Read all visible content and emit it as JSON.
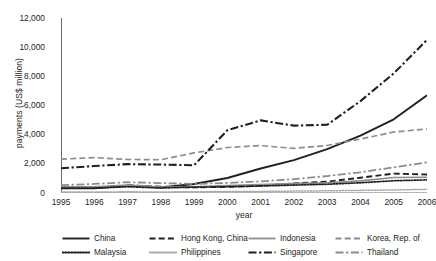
{
  "chart_data": {
    "type": "line",
    "title": "",
    "xlabel": "year",
    "ylabel": "payments (US$ million)",
    "x": [
      1995,
      1996,
      1997,
      1998,
      1999,
      2000,
      2001,
      2002,
      2003,
      2004,
      2005,
      2006
    ],
    "xtick_labels": [
      "1995",
      "1996",
      "1997",
      "1998",
      "1999",
      "2000",
      "2001",
      "2002",
      "2003",
      "2004",
      "2005",
      "2006"
    ],
    "ytick_labels": [
      "0",
      "2,000",
      "4,000",
      "6,000",
      "8,000",
      "10,000",
      "12,000"
    ],
    "yticks": [
      0,
      2000,
      4000,
      6000,
      8000,
      10000,
      12000
    ],
    "ylim": [
      0,
      12000
    ],
    "xlim": [
      1995,
      2006
    ],
    "grid": false,
    "legend_position": "bottom",
    "series": [
      {
        "name": "China",
        "style": "solid",
        "color": "#231f20",
        "width": 1.9,
        "values": [
          320,
          330,
          500,
          380,
          620,
          1030,
          1680,
          2250,
          3010,
          3940,
          5050,
          6700
        ]
      },
      {
        "name": "Hong Kong, China",
        "style": "dashed",
        "color": "#231f20",
        "width": 1.9,
        "values": [
          null,
          null,
          530,
          430,
          390,
          420,
          500,
          650,
          780,
          1050,
          1330,
          1270
        ]
      },
      {
        "name": "Indonesia",
        "style": "solid",
        "color": "#8c8c8c",
        "width": 1.6,
        "values": [
          430,
          430,
          540,
          400,
          430,
          510,
          580,
          640,
          700,
          830,
          1060,
          1080
        ]
      },
      {
        "name": "Korea, Rep. of",
        "style": "dashed",
        "color": "#8c8c8c",
        "width": 1.7,
        "values": [
          2320,
          2430,
          2300,
          2280,
          2750,
          3120,
          3250,
          3060,
          3260,
          3700,
          4180,
          4390
        ]
      },
      {
        "name": "Malaysia",
        "style": "dotted",
        "color": "#231f20",
        "width": 1.7,
        "values": [
          330,
          330,
          430,
          340,
          400,
          430,
          480,
          540,
          600,
          700,
          840,
          900
        ]
      },
      {
        "name": "Philippines",
        "style": "dotted",
        "color": "#a6a6a6",
        "width": 1.5,
        "values": [
          60,
          70,
          80,
          70,
          90,
          100,
          110,
          130,
          150,
          180,
          210,
          250
        ]
      },
      {
        "name": "Singapore",
        "style": "dashdot",
        "color": "#231f20",
        "width": 2.1,
        "values": [
          1700,
          1850,
          1980,
          1950,
          1900,
          4300,
          4980,
          4620,
          4680,
          6300,
          8200,
          10500
        ]
      },
      {
        "name": "Thailand",
        "style": "dashdot",
        "color": "#8c8c8c",
        "width": 1.8,
        "values": [
          540,
          620,
          740,
          680,
          620,
          690,
          800,
          950,
          1160,
          1420,
          1760,
          2100
        ]
      }
    ]
  },
  "legend": {
    "items": [
      {
        "label": "China"
      },
      {
        "label": "Hong Kong, China"
      },
      {
        "label": "Indonesia"
      },
      {
        "label": "Korea, Rep. of"
      },
      {
        "label": "Malaysia"
      },
      {
        "label": "Philippines"
      },
      {
        "label": "Singapore"
      },
      {
        "label": "Thailand"
      }
    ]
  }
}
